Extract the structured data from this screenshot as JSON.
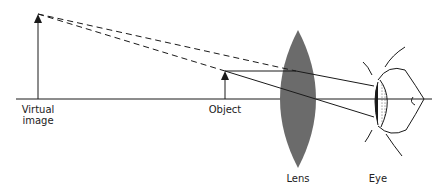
{
  "diagram": {
    "title": "",
    "labels": {
      "virtual_image_line1": "Virtual",
      "virtual_image_line2": "image",
      "object": "Object",
      "lens": "Lens",
      "eye": "Eye"
    },
    "colors": {
      "lens_fill": "#6b6b6b",
      "line": "#1a1a1a",
      "background": "#ffffff"
    },
    "elements": {
      "optical_axis_y": 99,
      "virtual_image": {
        "x": 38,
        "tip_y": 14,
        "base_y": 99
      },
      "object": {
        "x": 225,
        "tip_y": 71,
        "base_y": 99
      },
      "lens": {
        "cx": 298,
        "top_y": 30,
        "bottom_y": 168,
        "half_width": 25
      },
      "eye": {
        "x": 375
      }
    }
  }
}
